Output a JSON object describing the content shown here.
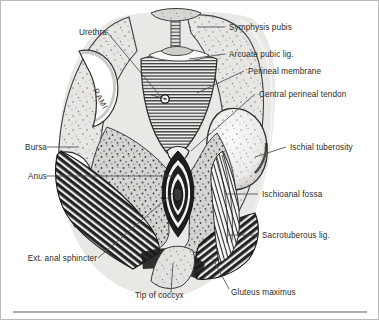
{
  "figure": {
    "view": "coronal-inferior perineal dissection",
    "palette": {
      "page_background": "#ffffff",
      "frame_border": "#b9b9b9",
      "label_text": "#2b2b2b",
      "leader_line": "#4a4a4a",
      "bone_fill": "#e8e6e3",
      "bone_outline": "#4a4a4a",
      "fossa_fill": "#d6d4d1",
      "fossa_stipple": "#2e2e2e",
      "muscle_dark": "#2b2b2b",
      "muscle_light": "#f2f1ef",
      "membrane_hatch": "#3a3a3a",
      "shadow_wash": "#cfcdca",
      "rule_line": "#5a5a5a"
    },
    "rule": {
      "present": true,
      "y": 311
    }
  },
  "labels": {
    "left": [
      {
        "id": "urethra",
        "text": "Urethra",
        "x": 63,
        "y": 27
      },
      {
        "id": "bursa",
        "text": "Bursa",
        "x": 14,
        "y": 142
      },
      {
        "id": "anus",
        "text": "Anus",
        "x": 20,
        "y": 171
      },
      {
        "id": "ext-anal-sphincter",
        "text": "Ext. anal sphincter",
        "x": 14,
        "y": 254
      }
    ],
    "right": [
      {
        "id": "symphysis-pubis",
        "text": "Symphysis pubis",
        "x": 228,
        "y": 22
      },
      {
        "id": "arcuate-pubic-lig",
        "text": "Arcuate pubic lig.",
        "x": 228,
        "y": 49
      },
      {
        "id": "perineal-membrane",
        "text": "Perineal membrane",
        "x": 247,
        "y": 66
      },
      {
        "id": "central-perineal-tendon",
        "text": "Central perineal tendon",
        "x": 258,
        "y": 89
      },
      {
        "id": "ischial-tuberosity",
        "text": "Ischial tuberosity",
        "x": 289,
        "y": 142
      },
      {
        "id": "ischioanal-fossa",
        "text": "Ischioanal fossa",
        "x": 261,
        "y": 189
      },
      {
        "id": "sacrotuberous-lig",
        "text": "Sacrotuberous lig.",
        "x": 261,
        "y": 230
      }
    ],
    "bottom": [
      {
        "id": "tip-of-coccyx",
        "text": "Tip of coccyx",
        "x": 134,
        "y": 295
      },
      {
        "id": "gluteus-maximus",
        "text": "Gluteus maximus",
        "x": 230,
        "y": 291
      }
    ],
    "inline": [
      {
        "id": "rami",
        "text": "RAMI",
        "x": 104,
        "y": 92,
        "rotation": 62
      }
    ]
  },
  "structures": [
    {
      "id": "symphysis-pubis",
      "name": "Symphysis pubis"
    },
    {
      "id": "arcuate-pubic-lig",
      "name": "Arcuate pubic lig."
    },
    {
      "id": "perineal-membrane",
      "name": "Perineal membrane"
    },
    {
      "id": "central-perineal-tendon",
      "name": "Central perineal tendon"
    },
    {
      "id": "ischial-tuberosity",
      "name": "Ischial tuberosity"
    },
    {
      "id": "ischioanal-fossa",
      "name": "Ischioanal fossa"
    },
    {
      "id": "sacrotuberous-lig",
      "name": "Sacrotuberous lig."
    },
    {
      "id": "gluteus-maximus",
      "name": "Gluteus maximus"
    },
    {
      "id": "ext-anal-sphincter",
      "name": "Ext. anal sphincter"
    },
    {
      "id": "anus",
      "name": "Anus"
    },
    {
      "id": "urethra",
      "name": "Urethra"
    },
    {
      "id": "bursa",
      "name": "Bursa"
    },
    {
      "id": "tip-of-coccyx",
      "name": "Tip of coccyx"
    },
    {
      "id": "rami",
      "name": "RAMI"
    }
  ]
}
